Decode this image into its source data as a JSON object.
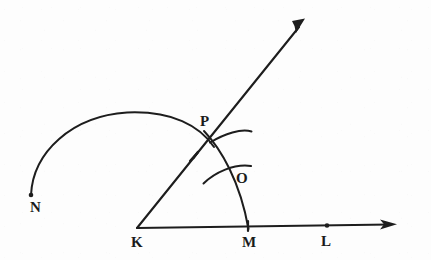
{
  "figure": {
    "kind": "geometry-construction-diagram",
    "background_color": "#fdfdfd",
    "ink_color": "#1d1d1d",
    "width": 431,
    "height": 260
  },
  "labels": [
    {
      "id": "N",
      "text": "N",
      "x": 30,
      "y": 200,
      "note": "endpoint of large arc, lower left"
    },
    {
      "id": "P",
      "text": "P",
      "x": 200,
      "y": 114,
      "note": "intersection of large arc and ray KP"
    },
    {
      "id": "O",
      "text": "O",
      "x": 236,
      "y": 171,
      "note": "intersection of small arcs inside angle"
    },
    {
      "id": "K",
      "text": "K",
      "x": 131,
      "y": 235,
      "note": "vertex of the angle"
    },
    {
      "id": "M",
      "text": "M",
      "x": 242,
      "y": 235,
      "note": "point on base ray where arc meets it"
    },
    {
      "id": "L",
      "text": "L",
      "x": 321,
      "y": 234,
      "note": "point further along base ray"
    }
  ],
  "points": [
    {
      "id": "K",
      "x": 137,
      "y": 228,
      "marker": "vertex"
    },
    {
      "id": "M",
      "x": 248,
      "y": 228,
      "marker": "tick"
    },
    {
      "id": "L",
      "x": 327,
      "y": 226,
      "marker": "dot"
    },
    {
      "id": "N",
      "x": 31,
      "y": 195,
      "marker": "dot"
    },
    {
      "id": "P",
      "x": 208,
      "y": 140,
      "marker": "intersection"
    },
    {
      "id": "O",
      "x": 231,
      "y": 172,
      "marker": "intersection"
    }
  ],
  "rays": [
    {
      "id": "ray-KL",
      "name": "base-ray",
      "from": {
        "x": 137,
        "y": 228
      },
      "to": {
        "x": 396,
        "y": 224
      },
      "arrowhead": true,
      "arrow_at": {
        "x": 396,
        "y": 224
      }
    },
    {
      "id": "ray-KP",
      "name": "angle-ray",
      "from": {
        "x": 137,
        "y": 228
      },
      "to": {
        "x": 305,
        "y": 20
      },
      "arrowhead": true,
      "arrow_at": {
        "x": 305,
        "y": 20
      }
    }
  ],
  "arcs": [
    {
      "id": "arc-NP",
      "name": "large-arc-N-to-P",
      "path": "M 31 195 C 35 150, 75 116, 128 113 C 172 111, 199 125, 213 146",
      "endpoints": [
        "N",
        "P"
      ]
    },
    {
      "id": "arc-PM",
      "name": "compass-arc-P-to-M",
      "path": "M 205 133 C 222 150, 240 180, 248 229",
      "endpoints": [
        "P",
        "M"
      ]
    },
    {
      "id": "arc-small-at-P",
      "name": "small-arc-near-P",
      "path": "M 210 142 C 226 133, 242 128, 251 131",
      "endpoints": []
    },
    {
      "id": "arc-small-at-O",
      "name": "small-arc-near-O",
      "path": "M 204 183 C 216 172, 234 164, 251 166",
      "endpoints": []
    }
  ],
  "tick_marks": [
    {
      "id": "ray-tick-KP",
      "name": "direction-tick-on-ray",
      "x": 195,
      "y": 155
    }
  ]
}
